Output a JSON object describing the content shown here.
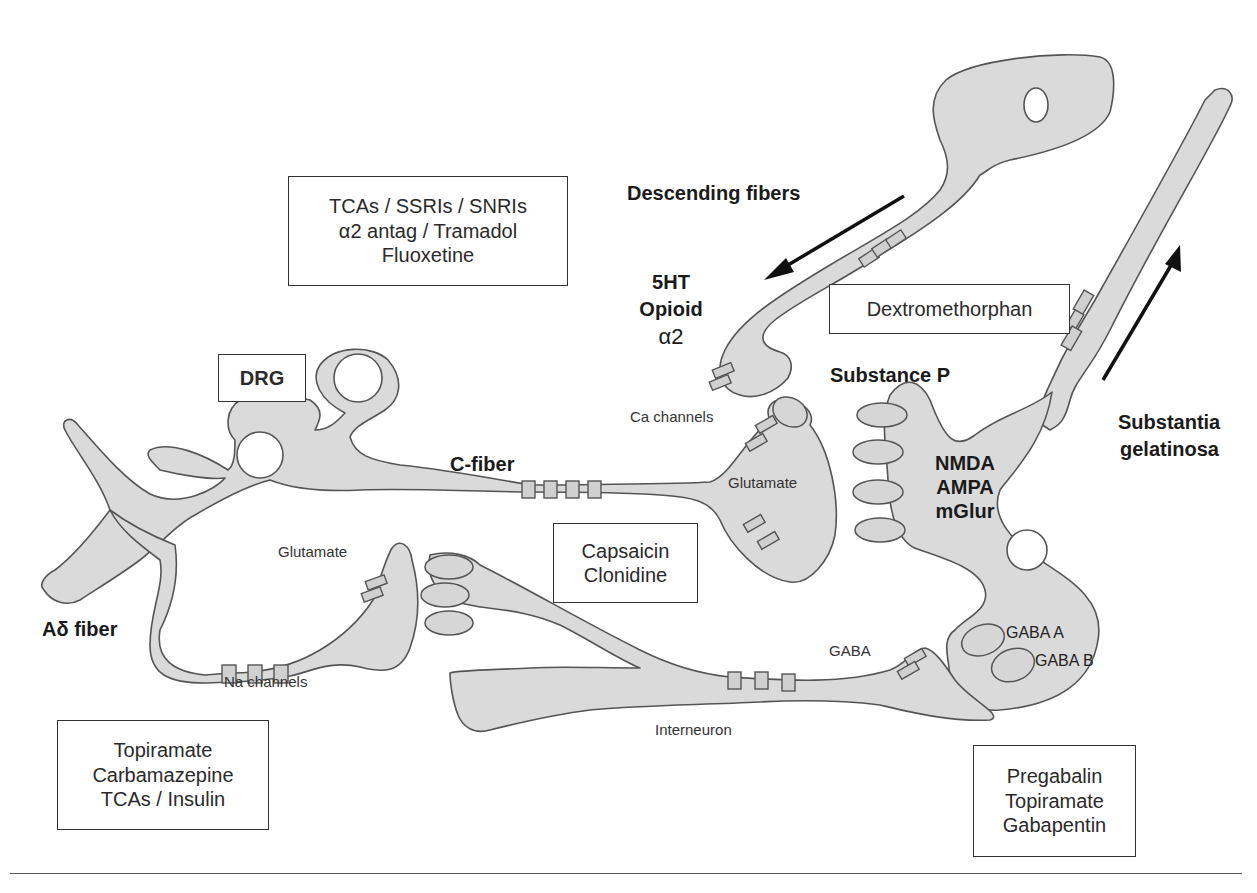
{
  "diagram": {
    "labels": {
      "descending_fibers": "Descending fibers",
      "ht5": "5HT",
      "opioid": "Opioid",
      "alpha2": "α2",
      "substance_p": "Substance P",
      "substantia_line1": "Substantia",
      "substantia_line2": "gelatinosa",
      "c_fiber": "C-fiber",
      "ca_channels": "Ca channels",
      "glutamate_c": "Glutamate",
      "nmda": "NMDA",
      "ampa": "AMPA",
      "mglur": "mGlur",
      "glutamate_a": "Glutamate",
      "a_delta_fiber": "Aδ fiber",
      "na_channels": "Na channels",
      "gaba": "GABA",
      "gaba_a": "GABA A",
      "gaba_b": "GABA B",
      "interneuron": "Interneuron"
    },
    "boxes": {
      "drg": "DRG",
      "antidepressants": [
        "TCAs / SSRIs / SNRIs",
        "α2 antag / Tramadol",
        "Fluoxetine"
      ],
      "dextromethorphan": [
        "Dextromethorphan"
      ],
      "capsaicin": [
        "Capsaicin",
        "Clonidine"
      ],
      "sodium_blockers": [
        "Topiramate",
        "Carbamazepine",
        "TCAs / Insulin"
      ],
      "calcium_blockers": [
        "Pregabalin",
        "Topiramate",
        "Gabapentin"
      ]
    },
    "colors": {
      "cell_fill": "#dadada",
      "cell_stroke": "#555555",
      "arrow": "#111111",
      "text": "#1c1c1c"
    }
  }
}
